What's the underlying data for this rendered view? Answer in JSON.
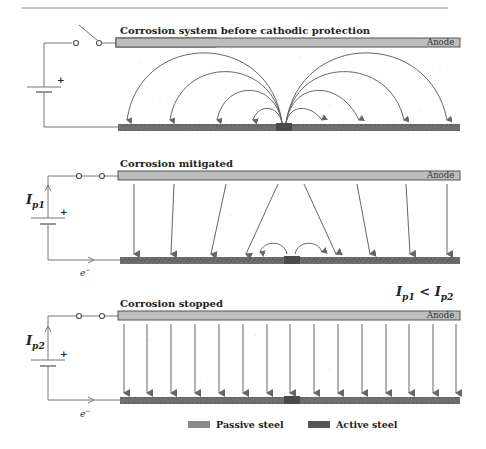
{
  "panels": [
    {
      "title": "Corrosion system before cathodic protection",
      "anode_label": "Anode",
      "switch_state": "open",
      "current_label": null,
      "current_flow": "macrocell arcs from active spot to passive steel"
    },
    {
      "title": "Corrosion mitigated",
      "anode_label": "Anode",
      "switch_state": "closed",
      "current_label": {
        "base": "I",
        "sub": "p1"
      },
      "electron_label": {
        "base": "e",
        "sup": "−"
      },
      "current_flow": "partial protection current from anode, small residual arcs"
    },
    {
      "title": "Corrosion stopped",
      "anode_label": "Anode",
      "switch_state": "closed",
      "current_label": {
        "base": "I",
        "sub": "p2"
      },
      "electron_label": {
        "base": "e",
        "sup": "−"
      },
      "current_flow": "uniform protection current from anode to steel"
    }
  ],
  "inequality": {
    "left_base": "I",
    "left_sub": "p1",
    "op": "<",
    "right_base": "I",
    "right_sub": "p2"
  },
  "legend": [
    {
      "label": "Passive steel",
      "color": "#8a8a8a"
    },
    {
      "label": "Active steel",
      "color": "#555555"
    }
  ],
  "battery_plus": "+",
  "colors": {
    "anode": "#bdbdbd",
    "steel": "#6e6e6e",
    "active": "#4a4a4a",
    "arrow": "#666666",
    "wire": "#777777"
  }
}
